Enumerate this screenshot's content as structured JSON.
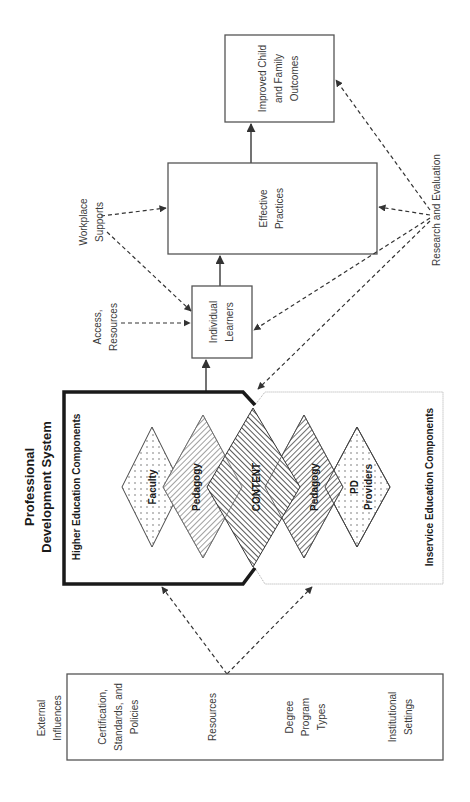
{
  "title": {
    "line1": "Professional",
    "line2": "Development System"
  },
  "outcome_box": {
    "line1": "Improved Child",
    "line2": "and Family",
    "line3": "Outcomes"
  },
  "practices_box": {
    "line1": "Effective",
    "line2": "Practices"
  },
  "learners_box": {
    "line1": "Individual",
    "line2": "Learners"
  },
  "labels": {
    "workplace_line1": "Workplace",
    "workplace_line2": "Supports",
    "access_line1": "Access,",
    "access_line2": "Resources",
    "research": "Research and Evaluation",
    "external_line1": "External",
    "external_line2": "Influences"
  },
  "higher_ed": {
    "label": "Higher Education Components"
  },
  "inservice": {
    "label": "Inservice Education Components"
  },
  "diamonds": {
    "faculty": "Faculty",
    "pedagogy_left": "Pedagogy",
    "content": "CONTENT",
    "pedagogy_right": "Pedagogy",
    "pd_line1": "PD",
    "pd_line2": "Providers"
  },
  "external_influences": {
    "items": [
      {
        "line1": "Certification,",
        "line2": "Standards, and",
        "line3": "Policies"
      },
      {
        "line1": "Resources"
      },
      {
        "line1": "Degree",
        "line2": "Program",
        "line3": "Types"
      },
      {
        "line1": "Institutional",
        "line2": "Settings"
      }
    ]
  },
  "colors": {
    "line": "#333333",
    "thick_border": "#1a1a1a",
    "inservice_border": "#aaaaaa"
  }
}
